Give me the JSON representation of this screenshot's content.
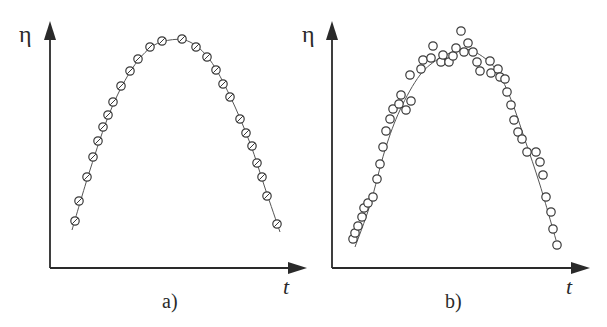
{
  "figure": {
    "colors": {
      "ink": "#2a2a2a",
      "curve": "#555555",
      "marker": "#3a3a3a",
      "background": "#ffffff"
    }
  },
  "chart_data": [
    {
      "type": "scatter",
      "panel_label": "a)",
      "title": "",
      "xlabel": "t",
      "ylabel": "η",
      "grid": false,
      "legend": null,
      "description": "Measured points lying exactly on a parabolic fit curve (noise-free)",
      "pixel_axes": {
        "origin": [
          51,
          268
        ],
        "x_end": [
          306,
          268
        ],
        "y_end": [
          49,
          22
        ]
      },
      "fit_curve": {
        "type": "parabola",
        "pixel_points": [
          [
            72,
            230
          ],
          [
            90,
            170
          ],
          [
            110,
            112
          ],
          [
            130,
            72
          ],
          [
            150,
            48
          ],
          [
            170,
            40
          ],
          [
            190,
            42
          ],
          [
            210,
            60
          ],
          [
            230,
            96
          ],
          [
            250,
            143
          ],
          [
            265,
            188
          ],
          [
            280,
            232
          ]
        ]
      },
      "points_pixel": [
        [
          75,
          221
        ],
        [
          79,
          201
        ],
        [
          87,
          177
        ],
        [
          93,
          157
        ],
        [
          98,
          141
        ],
        [
          103,
          127
        ],
        [
          108,
          115
        ],
        [
          113,
          102
        ],
        [
          121,
          86
        ],
        [
          130,
          71
        ],
        [
          138,
          59
        ],
        [
          150,
          47
        ],
        [
          162,
          41
        ],
        [
          182,
          39
        ],
        [
          196,
          47
        ],
        [
          207,
          57
        ],
        [
          216,
          70
        ],
        [
          223,
          84
        ],
        [
          230,
          97
        ],
        [
          240,
          119
        ],
        [
          246,
          133
        ],
        [
          252,
          146
        ],
        [
          257,
          163
        ],
        [
          262,
          177
        ],
        [
          267,
          196
        ],
        [
          277,
          224
        ]
      ],
      "marker": "circle-hatched"
    },
    {
      "type": "scatter",
      "panel_label": "b)",
      "title": "",
      "xlabel": "t",
      "ylabel": "η",
      "grid": false,
      "legend": null,
      "description": "Noisy measured points scattered around a parabolic fit curve",
      "pixel_axes": {
        "origin": [
          332,
          268
        ],
        "x_end": [
          589,
          268
        ],
        "y_end": [
          331,
          22
        ]
      },
      "fit_curve": {
        "type": "parabola",
        "pixel_points": [
          [
            355,
            247
          ],
          [
            370,
            205
          ],
          [
            385,
            150
          ],
          [
            400,
            110
          ],
          [
            420,
            75
          ],
          [
            440,
            58
          ],
          [
            460,
            50
          ],
          [
            475,
            52
          ],
          [
            495,
            68
          ],
          [
            510,
            97
          ],
          [
            525,
            140
          ],
          [
            540,
            185
          ],
          [
            556,
            240
          ]
        ]
      },
      "points_pixel": [
        [
          353,
          239
        ],
        [
          355,
          233
        ],
        [
          358,
          226
        ],
        [
          362,
          217
        ],
        [
          364,
          208
        ],
        [
          368,
          203
        ],
        [
          373,
          197
        ],
        [
          377,
          179
        ],
        [
          380,
          164
        ],
        [
          383,
          147
        ],
        [
          386,
          131
        ],
        [
          390,
          119
        ],
        [
          393,
          109
        ],
        [
          399,
          104
        ],
        [
          401,
          95
        ],
        [
          406,
          110
        ],
        [
          411,
          101
        ],
        [
          410,
          75
        ],
        [
          421,
          69
        ],
        [
          423,
          60
        ],
        [
          431,
          58
        ],
        [
          433,
          46
        ],
        [
          441,
          62
        ],
        [
          443,
          55
        ],
        [
          449,
          62
        ],
        [
          453,
          56
        ],
        [
          456,
          48
        ],
        [
          461,
          31
        ],
        [
          464,
          52
        ],
        [
          468,
          43
        ],
        [
          473,
          52
        ],
        [
          477,
          62
        ],
        [
          480,
          71
        ],
        [
          490,
          61
        ],
        [
          491,
          73
        ],
        [
          498,
          69
        ],
        [
          500,
          77
        ],
        [
          505,
          79
        ],
        [
          507,
          92
        ],
        [
          511,
          105
        ],
        [
          514,
          120
        ],
        [
          518,
          132
        ],
        [
          522,
          139
        ],
        [
          527,
          152
        ],
        [
          536,
          152
        ],
        [
          540,
          162
        ],
        [
          543,
          175
        ],
        [
          546,
          197
        ],
        [
          551,
          212
        ],
        [
          553,
          229
        ],
        [
          557,
          245
        ]
      ],
      "marker": "circle-open"
    }
  ],
  "labels": {
    "a": {
      "y_axis": "η",
      "x_axis": "t",
      "panel": "a)"
    },
    "b": {
      "y_axis": "η",
      "x_axis": "t",
      "panel": "b)"
    }
  }
}
